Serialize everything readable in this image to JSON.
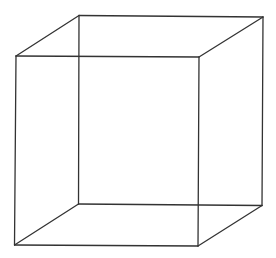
{
  "diagram": {
    "type": "wireframe-cube",
    "colors": {
      "background": "#ffffff",
      "stroke": "#333333"
    },
    "vertices": {
      "front-top-left": "front face, top-left corner",
      "front-top-right": "front face, top-right corner",
      "front-bottom-left": "front face, bottom-left corner",
      "front-bottom-right": "front face, bottom-right corner",
      "back-top-left": "back face, top-left corner",
      "back-top-right": "back face, top-right corner",
      "back-bottom-left": "back face, bottom-left corner",
      "back-bottom-right": "back face, bottom-right corner"
    },
    "edges": [
      [
        "front-top-left",
        "front-top-right"
      ],
      [
        "front-top-right",
        "front-bottom-right"
      ],
      [
        "front-bottom-right",
        "front-bottom-left"
      ],
      [
        "front-bottom-left",
        "front-top-left"
      ],
      [
        "back-top-left",
        "back-top-right"
      ],
      [
        "back-top-right",
        "back-bottom-right"
      ],
      [
        "back-bottom-right",
        "back-bottom-left"
      ],
      [
        "back-bottom-left",
        "back-top-left"
      ],
      [
        "front-top-left",
        "back-top-left"
      ],
      [
        "front-top-right",
        "back-top-right"
      ],
      [
        "front-bottom-left",
        "back-bottom-left"
      ],
      [
        "front-bottom-right",
        "back-bottom-right"
      ]
    ]
  }
}
